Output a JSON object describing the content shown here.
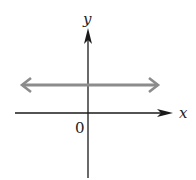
{
  "diagram": {
    "type": "coordinate-plane",
    "axes": {
      "x_label": "x",
      "y_label": "y",
      "origin_label": "0"
    },
    "line": {
      "description": "horizontal line above x-axis, extending both directions",
      "color": "#8c8c8c"
    },
    "axis_color": "#1a1a1a"
  }
}
